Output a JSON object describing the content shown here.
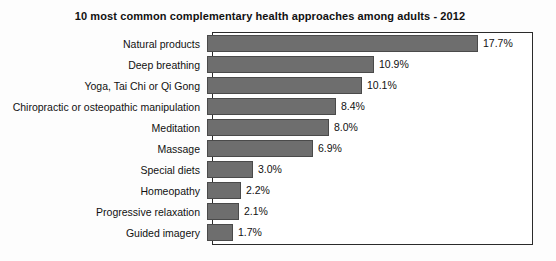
{
  "chart_data": {
    "type": "bar",
    "orientation": "horizontal",
    "title": "10 most common complementary health approaches among adults - 2012",
    "xlabel": "",
    "ylabel": "",
    "xlim": [
      0,
      21
    ],
    "grid": false,
    "legend": null,
    "value_suffix": "%",
    "bar_color": "#6e6e6e",
    "bar_border_color": "#4a4a4a",
    "plot_border_color": "#2b2b2b",
    "background_color": "#fdfdfd",
    "categories": [
      "Natural products",
      "Deep breathing",
      "Yoga, Tai Chi or Qi Gong",
      "Chiropractic or osteopathic manipulation",
      "Meditation",
      "Massage",
      "Special diets",
      "Homeopathy",
      "Progressive relaxation",
      "Guided imagery"
    ],
    "values": [
      17.7,
      10.9,
      10.1,
      8.4,
      8.0,
      6.9,
      3.0,
      2.2,
      2.1,
      1.7
    ],
    "value_labels": [
      "17.7%",
      "10.9%",
      "10.1%",
      "8.4%",
      "8.0%",
      "6.9%",
      "3.0%",
      "2.2%",
      "2.1%",
      "1.7%"
    ]
  }
}
